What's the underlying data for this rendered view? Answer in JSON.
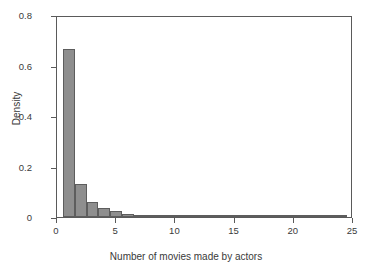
{
  "chart_data": {
    "type": "bar",
    "title": "",
    "subtitle": "",
    "xlabel": "Number of movies made by actors",
    "ylabel": "Density",
    "xlim": [
      0,
      25
    ],
    "ylim": [
      0,
      0.8
    ],
    "grid": false,
    "legend": null,
    "bin_width": 1,
    "bar_color": "#8e8e8e",
    "bar_border_color": "#5d5d5d",
    "frame_color": "#5a5a5a",
    "xticks": [
      "0",
      "5",
      "10",
      "15",
      "20",
      "25"
    ],
    "xtick_values": [
      0,
      5,
      10,
      15,
      20,
      25
    ],
    "yticks": [
      "0",
      "0.2",
      "0.4",
      "0.6",
      "0.8"
    ],
    "ytick_values": [
      0,
      0.2,
      0.4,
      0.6,
      0.8
    ],
    "categories": [
      1,
      2,
      3,
      4,
      5,
      6,
      7,
      8,
      9,
      10,
      11,
      12,
      13,
      14,
      15,
      16,
      17,
      18,
      19,
      20,
      21,
      22,
      23,
      24
    ],
    "bin_edges": [
      0.5,
      1.5,
      2.5,
      3.5,
      4.5,
      5.5,
      6.5,
      7.5,
      8.5,
      9.5,
      10.5,
      11.5,
      12.5,
      13.5,
      14.5,
      15.5,
      16.5,
      17.5,
      18.5,
      19.5,
      20.5,
      21.5,
      22.5,
      23.5,
      24.5
    ],
    "values": [
      0.665,
      0.131,
      0.058,
      0.034,
      0.024,
      0.012,
      0.009,
      0.007,
      0.005,
      0.0055,
      0.0045,
      0.003,
      0.002,
      0.002,
      0.0015,
      0.0012,
      0.001,
      0.001,
      0.001,
      0.001,
      0.0008,
      0.0008,
      0.0025,
      0.0012
    ]
  }
}
